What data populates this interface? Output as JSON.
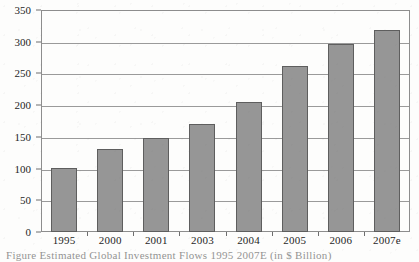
{
  "chart_data": {
    "type": "bar",
    "title": "",
    "xlabel": "",
    "ylabel": "",
    "categories": [
      "1995",
      "2000",
      "2001",
      "2003",
      "2004",
      "2005",
      "2006",
      "2007e"
    ],
    "values": [
      101,
      131,
      148,
      170,
      205,
      262,
      297,
      318
    ],
    "ylim": [
      0,
      350
    ],
    "ytick_labels": [
      "0",
      "50",
      "100",
      "150",
      "200",
      "250",
      "300",
      "350"
    ],
    "ytick_values": [
      0,
      50,
      100,
      150,
      200,
      250,
      300,
      350
    ],
    "grid": true,
    "legend": false,
    "legend_position": "none",
    "series": [
      {
        "name": "",
        "values": [
          101,
          131,
          148,
          170,
          205,
          262,
          297,
          318
        ]
      }
    ],
    "bar_color": "#969696",
    "bar_edge_color": "#5e5e5e",
    "grid_color": "#9a9a9a",
    "frame_color": "#8d8d8d",
    "background_color": "#fdfdfc"
  },
  "caption": {
    "clipped_line": "Figure   Estimated Global Investment Flows  1995 2007E (in $ Billion)"
  }
}
